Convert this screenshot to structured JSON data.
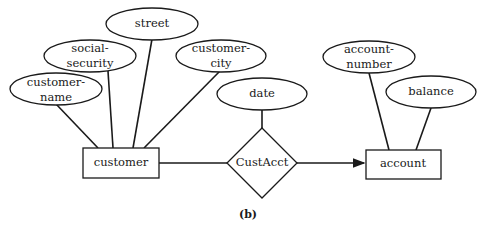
{
  "diagram": {
    "type": "er-diagram",
    "caption": "(b)",
    "entities": [
      {
        "id": "customer",
        "label": "customer"
      },
      {
        "id": "account",
        "label": "account"
      }
    ],
    "relationships": [
      {
        "id": "custacct",
        "label": "CustAcct"
      }
    ],
    "attributes": [
      {
        "id": "customer-name",
        "line1": "customer-",
        "line2": "name",
        "of": "customer"
      },
      {
        "id": "social-security",
        "line1": "social-",
        "line2": "security",
        "of": "customer"
      },
      {
        "id": "street",
        "line1": "street",
        "of": "customer"
      },
      {
        "id": "customer-city",
        "line1": "customer-",
        "line2": "city",
        "of": "customer"
      },
      {
        "id": "date",
        "line1": "date",
        "of": "CustAcct"
      },
      {
        "id": "account-number",
        "line1": "account-",
        "line2": "number",
        "of": "account"
      },
      {
        "id": "balance",
        "line1": "balance",
        "of": "account"
      }
    ],
    "edges": [
      {
        "from": "customer",
        "to": "CustAcct",
        "arrow": false
      },
      {
        "from": "CustAcct",
        "to": "account",
        "arrow": true
      }
    ]
  }
}
